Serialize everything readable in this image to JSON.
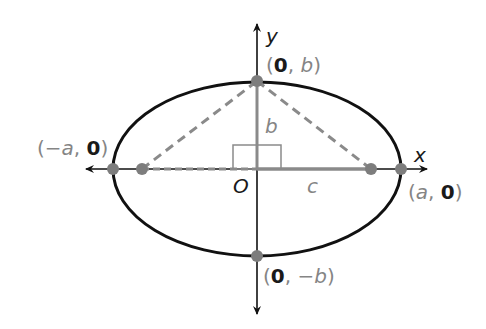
{
  "diagram": {
    "colors": {
      "curve": "#111111",
      "axis": "#111111",
      "highlight": "#8a8a8a",
      "label_gray": "#858585",
      "label_dark": "#1a1a1a"
    },
    "axes": {
      "x_label": "x",
      "y_label": "y",
      "origin_label": "O"
    },
    "segments": {
      "b_label": "b",
      "c_label": "c"
    },
    "points": {
      "top": {
        "open": "(",
        "x": "0",
        "sep": ", ",
        "y": "b",
        "close": ")"
      },
      "bottom": {
        "open": "(",
        "x": "0",
        "sep": ", ",
        "y": "−b",
        "close": ")"
      },
      "left": {
        "open": "(",
        "x": "−a",
        "sep": ", ",
        "y": "0",
        "close": ")"
      },
      "right": {
        "open": "(",
        "x": "a",
        "sep": ", ",
        "y": "0",
        "close": ")"
      }
    }
  }
}
